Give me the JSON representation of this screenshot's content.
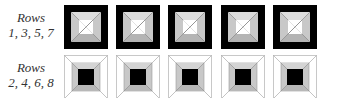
{
  "rows": [
    {
      "label_line1": "Rows",
      "label_line2": "1, 3, 5, 7",
      "tile_type": "black-frame-white-center",
      "y": 5
    },
    {
      "label_line1": "Rows",
      "label_line2": "2, 4, 6, 8",
      "tile_type": "white-frame-black-center",
      "y": 55
    }
  ],
  "tile_x": [
    64,
    116,
    168,
    221,
    273
  ],
  "colors": {
    "black": "#000000",
    "gray": "#c8c8c8",
    "white": "#ffffff",
    "line": "#8a8a8a"
  }
}
